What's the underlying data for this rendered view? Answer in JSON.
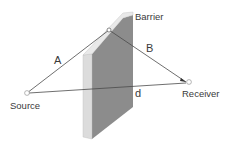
{
  "diagram": {
    "type": "acoustic-barrier-path-difference",
    "labels": {
      "barrier": "Barrier",
      "path_a": "A",
      "path_b": "B",
      "direct_path": "d",
      "source": "Source",
      "receiver": "Receiver"
    },
    "colors": {
      "barrier_face": "#8c8c8c",
      "barrier_edge": "#dcdcdc",
      "barrier_top": "#e6e6e6",
      "line": "#4a4a4a",
      "text": "#3a3a3a"
    },
    "points": {
      "source": {
        "x": 27,
        "y": 93
      },
      "receiver": {
        "x": 189,
        "y": 82
      },
      "diffraction": {
        "x": 109,
        "y": 30
      }
    }
  }
}
